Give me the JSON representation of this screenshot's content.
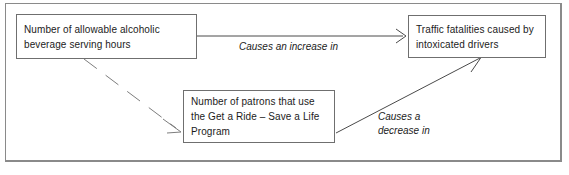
{
  "diagram": {
    "type": "causal-loop-diagram",
    "frame": {
      "border_color": "#8a8a8a"
    },
    "nodes": [
      {
        "id": "alcohol-hours",
        "label": "Number of allowable alcoholic beverage serving hours"
      },
      {
        "id": "ride-program",
        "label": "Number of patrons that use the Get a Ride – Save a Life Program"
      },
      {
        "id": "traffic-fatalities",
        "label": "Traffic fatalities caused by intoxicated drivers"
      }
    ],
    "edges": [
      {
        "id": "increase",
        "from": "alcohol-hours",
        "to": "traffic-fatalities",
        "label": "Causes an increase in",
        "style": "solid",
        "color": "#4a4a4a"
      },
      {
        "id": "influence",
        "from": "alcohol-hours",
        "to": "ride-program",
        "label": "",
        "style": "dashed",
        "color": "#7d7d7d"
      },
      {
        "id": "decrease",
        "from": "ride-program",
        "to": "traffic-fatalities",
        "label": "Causes a\ndecrease in",
        "style": "solid",
        "color": "#4a4a4a"
      }
    ]
  }
}
